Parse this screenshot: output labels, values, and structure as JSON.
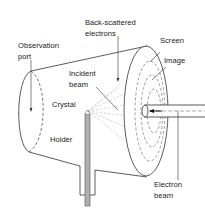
{
  "diagram": {
    "type": "LEED apparatus schematic",
    "labels": {
      "observation_port": [
        "Observation",
        "port"
      ],
      "back_scattered": [
        "Back-scattered",
        "electrons"
      ],
      "screen": "Screen",
      "image": "Image",
      "incident_beam": [
        "Incident",
        "beam"
      ],
      "crystal": "Crystal",
      "holder": "Holder",
      "electron_beam": [
        "Electron",
        "beam"
      ]
    },
    "colors": {
      "line": "#333333",
      "dashed": "#777777",
      "scatter": "#c8c8c8",
      "holder_fill": "#b0b0b0",
      "background": "#ffffff"
    }
  }
}
